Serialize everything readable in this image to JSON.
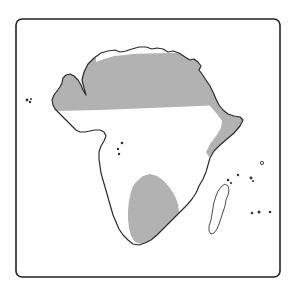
{
  "figure": {
    "kind": "map",
    "region": "Africa",
    "projection_note": "simple outline map",
    "background_color": "#ffffff"
  },
  "frame": {
    "name": "map-border",
    "x": 16,
    "y": 19,
    "width": 264,
    "height": 258,
    "corner_radius": 6,
    "stroke_color": "#222222",
    "stroke_width": 1.6,
    "fill_color": "#ffffff"
  },
  "style": {
    "shaded_fill": "#b2b2b2",
    "shaded_label": "shaded range",
    "unshaded_fill": "#ffffff",
    "unshaded_label": "unshaded area",
    "coast_stroke": "#2b2b2b",
    "coast_stroke_width": 1.2,
    "island_stroke": "#3a3a3a",
    "island_stroke_width": 0.9,
    "dot_fill": "#2f2f2f"
  },
  "landmasses": [
    {
      "name": "africa-mainland",
      "label": "Africa mainland",
      "outline_path": "M 86 95 L 84 88 L 82 80 L 84 72 L 88 64 L 94 58 L 101 53 L 108 51 L 115 50 L 120 52 L 126 51 L 132 49 L 139 47 L 146 47 L 152 49 L 157 48 L 163 49 L 168 52 L 173 51 L 179 53 L 185 57 L 190 60 L 194 59 L 198 62 L 201 66 L 199 70 L 202 74 L 206 80 L 210 86 L 213 92 L 216 99 L 219 105 L 223 110 L 228 114 L 234 116 L 240 117 L 243 120 L 240 126 L 234 133 L 227 139 L 220 145 L 214 151 L 210 158 L 208 165 L 206 172 L 203 179 L 199 186 L 196 193 L 192 199 L 187 205 L 181 211 L 175 217 L 169 223 L 163 229 L 157 235 L 151 240 L 145 243 L 139 245 L 133 244 L 128 240 L 123 235 L 119 229 L 116 222 L 113 215 L 111 208 L 109 201 L 107 194 L 105 187 L 103 180 L 101 173 L 100 166 L 99 159 L 99 152 L 101 146 L 104 141 L 106 136 L 104 132 L 100 130 L 95 130 L 90 131 L 85 132 L 80 132 L 76 130 L 73 127 L 70 124 L 67 121 L 64 118 L 61 115 L 58 112 L 55 109 L 53 105 L 52 100 L 54 95 L 57 91 L 60 87 L 62 83 L 63 78 L 66 75 L 70 74 L 74 76 L 78 80 L 81 85 L 83 90 Z"
    },
    {
      "name": "madagascar",
      "label": "Madagascar",
      "outline_path": "M 222 186 L 225 184 L 228 186 L 229 190 L 228 195 L 226 200 L 225 206 L 223 212 L 221 218 L 219 224 L 217 229 L 214 233 L 211 234 L 209 231 L 209 226 L 211 220 L 212 214 L 213 208 L 214 202 L 216 196 L 218 191 Z"
    }
  ],
  "shaded_regions": [
    {
      "name": "sahara-shading",
      "label": "Saharan range (northern shaded band)",
      "description": "Shaded from the Mediterranean coast south to the Sahel line"
    },
    {
      "name": "horn-of-africa-shading",
      "label": "Horn of Africa shaded area"
    },
    {
      "name": "southern-africa-shading",
      "label": "Southern Africa shaded area (Kalahari / Namib)"
    }
  ],
  "island_dots": [
    {
      "name": "cape-verde-dot-1",
      "label": "Cape Verde",
      "cx": 27,
      "cy": 100,
      "r": 1.4
    },
    {
      "name": "cape-verde-dot-2",
      "label": "Cape Verde",
      "cx": 30,
      "cy": 102,
      "r": 1.2
    },
    {
      "name": "cape-verde-dot-3",
      "label": "Cape Verde",
      "cx": 31,
      "cy": 99,
      "r": 1.0
    },
    {
      "name": "bioko-dot",
      "label": "Bioko",
      "cx": 122,
      "cy": 143,
      "r": 1.3
    },
    {
      "name": "principe-dot",
      "label": "Principe",
      "cx": 118,
      "cy": 149,
      "r": 1.2
    },
    {
      "name": "sao-tome-dot",
      "label": "Sao Tome",
      "cx": 119,
      "cy": 154,
      "r": 1.2
    },
    {
      "name": "comoros-dot-1",
      "label": "Comoros",
      "cx": 228,
      "cy": 180,
      "r": 1.3
    },
    {
      "name": "comoros-dot-2",
      "label": "Comoros",
      "cx": 231,
      "cy": 183,
      "r": 1.1
    },
    {
      "name": "seychelles-dot-1",
      "label": "Seychelles",
      "cx": 238,
      "cy": 175,
      "r": 1.2
    },
    {
      "name": "seychelles-dot-2",
      "label": "Seychelles",
      "cx": 251,
      "cy": 178,
      "r": 1.4
    },
    {
      "name": "seychelles-dot-3",
      "label": "Seychelles",
      "cx": 253,
      "cy": 181,
      "r": 1.1
    },
    {
      "name": "aldabra-dot",
      "label": "Aldabra",
      "cx": 262,
      "cy": 163,
      "r": 1.6
    },
    {
      "name": "reunion-dot",
      "label": "Reunion",
      "cx": 252,
      "cy": 213,
      "r": 1.3
    },
    {
      "name": "mauritius-dot",
      "label": "Mauritius",
      "cx": 259,
      "cy": 212,
      "r": 1.5
    },
    {
      "name": "rodrigues-dot",
      "label": "Rodrigues",
      "cx": 270,
      "cy": 212,
      "r": 1.3
    }
  ]
}
